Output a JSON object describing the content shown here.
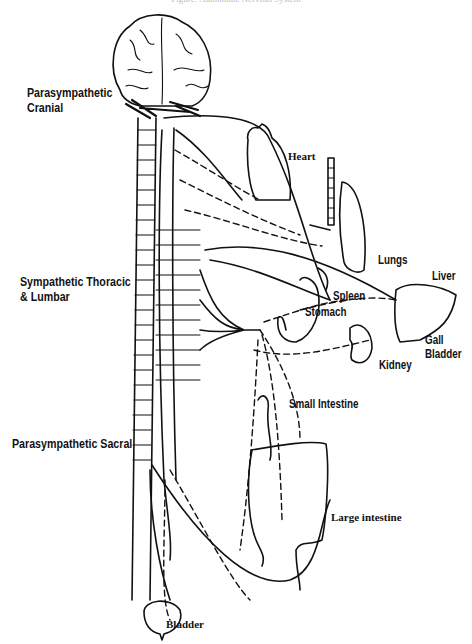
{
  "caption": "Figure: Autonomic Nervous System",
  "diagram": {
    "regions": {
      "cranial": "Parasympathetic",
      "cranial_line2": "Cranial",
      "thoracic": "Sympathetic Thoracic",
      "thoracic_line2": "& Lumbar",
      "sacral": "Parasympathetic Sacral"
    },
    "organs": {
      "heart": "Heart",
      "lungs": "Lungs",
      "liver": "Liver",
      "spleen": "Spleen",
      "stomach": "Stomach",
      "gall": "Gall",
      "gall_line2": "Bladder",
      "kidney": "Kidney",
      "small_intestine": "Small Intestine",
      "large_intestine": "Large intestine",
      "bladder": "Bladder"
    },
    "legend": {
      "solid_line": "preganglionic fiber",
      "dashed_line": "postganglionic fiber"
    }
  }
}
